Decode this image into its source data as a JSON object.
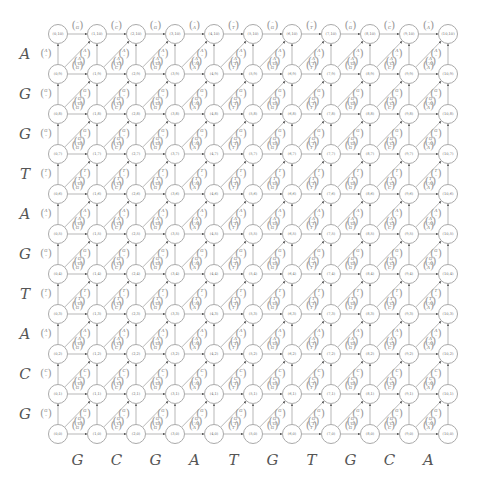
{
  "diagram": {
    "title": "",
    "grid": {
      "cols": 11,
      "rows": 11,
      "x0": 58,
      "y0": 434,
      "dx": 39,
      "dy": 40,
      "node_radius": 10
    },
    "seq_x": [
      "G",
      "C",
      "G",
      "A",
      "T",
      "G",
      "T",
      "G",
      "C",
      "A"
    ],
    "seq_y": [
      "G",
      "C",
      "A",
      "T",
      "G",
      "A",
      "T",
      "G",
      "G",
      "A"
    ],
    "gap_symbol": "–",
    "colors": {
      "node_border": "#aaaaaa",
      "edge": "#999999",
      "text": "#555555"
    }
  }
}
